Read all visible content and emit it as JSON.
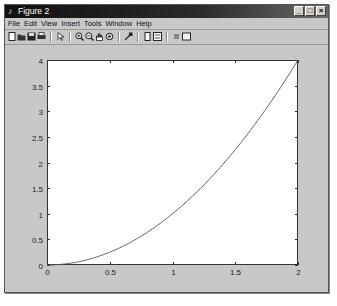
{
  "window": {
    "title": "Figure 2",
    "controls": {
      "minimize": "_",
      "maximize": "□",
      "close": "×"
    }
  },
  "menubar": {
    "items": [
      "File",
      "Edit",
      "View",
      "Insert",
      "Tools",
      "Window",
      "Help"
    ]
  },
  "toolbar": {
    "buttons": [
      {
        "name": "new-figure-icon",
        "glyph": "▯"
      },
      {
        "name": "open-file-icon",
        "glyph": "▰"
      },
      {
        "name": "save-icon",
        "glyph": "■"
      },
      {
        "name": "print-icon",
        "glyph": "▤"
      },
      {
        "name": "edit-plot-arrow-icon",
        "glyph": "↖"
      },
      {
        "name": "zoom-in-icon",
        "glyph": "⊕"
      },
      {
        "name": "zoom-out-icon",
        "glyph": "⊖"
      },
      {
        "name": "pan-hand-icon",
        "glyph": "✋"
      },
      {
        "name": "rotate-3d-icon",
        "glyph": "⟳"
      },
      {
        "name": "data-cursor-icon",
        "glyph": "⌖"
      },
      {
        "name": "insert-colorbar-icon",
        "glyph": "▯"
      },
      {
        "name": "insert-legend-icon",
        "glyph": "▤"
      },
      {
        "name": "hide-plot-tools-icon",
        "glyph": "▪"
      },
      {
        "name": "show-plot-tools-icon",
        "glyph": "▢"
      }
    ]
  },
  "chart_data": {
    "type": "line",
    "title": "",
    "xlabel": "",
    "ylabel": "",
    "function": "y = x^2",
    "xlim": [
      0,
      2
    ],
    "ylim": [
      0,
      4
    ],
    "xticks": [
      0,
      0.5,
      1,
      1.5,
      2
    ],
    "xtick_labels": [
      "0",
      "0.5",
      "1",
      "1.5",
      "2"
    ],
    "yticks": [
      0,
      0.5,
      1,
      1.5,
      2,
      2.5,
      3,
      3.5,
      4
    ],
    "ytick_labels": [
      "0",
      "0.5",
      "1",
      "1.5",
      "2",
      "2.5",
      "3",
      "3.5",
      "4"
    ],
    "grid": false,
    "legend": null,
    "series": [
      {
        "name": "y",
        "color": "#555555",
        "x": [
          0,
          0.1,
          0.2,
          0.3,
          0.4,
          0.5,
          0.6,
          0.7,
          0.8,
          0.9,
          1.0,
          1.1,
          1.2,
          1.3,
          1.4,
          1.5,
          1.6,
          1.7,
          1.8,
          1.9,
          2.0
        ],
        "y": [
          0,
          0.01,
          0.04,
          0.09,
          0.16,
          0.25,
          0.36,
          0.49,
          0.64,
          0.81,
          1.0,
          1.21,
          1.44,
          1.69,
          1.96,
          2.25,
          2.56,
          2.89,
          3.24,
          3.61,
          4.0
        ]
      }
    ]
  }
}
